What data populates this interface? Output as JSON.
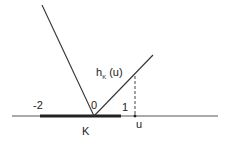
{
  "diagram": {
    "type": "support-function-graph",
    "colors": {
      "line": "#333333",
      "axis": "#555555",
      "segment": "#222222",
      "dashed": "#444444"
    },
    "axis": {
      "x1": 12,
      "y": 116,
      "x2": 218
    },
    "segment_K": {
      "x1": 40,
      "x2": 121,
      "y": 116
    },
    "left_ray": {
      "x1": 42,
      "y1": 5,
      "x2": 94,
      "y2": 116
    },
    "right_ray": {
      "x1": 94,
      "y1": 116,
      "x2": 153,
      "y2": 55
    },
    "dashed_line": {
      "x": 135,
      "y1": 76,
      "y2": 116
    },
    "point_u": {
      "x": 135,
      "y": 116
    },
    "labels": {
      "minus_two": "-2",
      "zero": "0",
      "one": "1",
      "u": "u",
      "K": "K",
      "h_main": "h",
      "h_sub": "K",
      "h_arg": " (u)"
    }
  }
}
